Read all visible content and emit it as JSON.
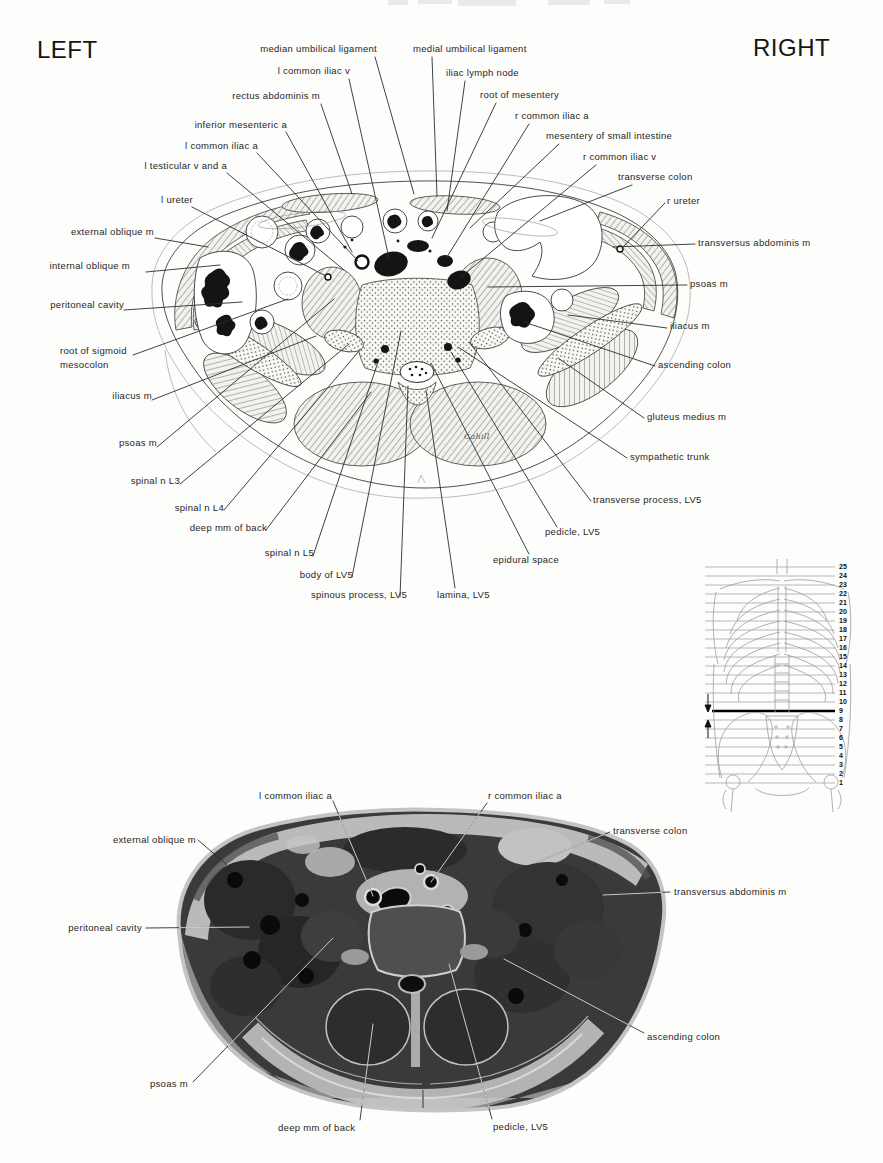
{
  "page": {
    "left_marker": "LEFT",
    "right_marker": "RIGHT",
    "artist_signature": "Cahill"
  },
  "figure_drawing": {
    "labels": [
      {
        "text": "median umbilical ligament"
      },
      {
        "text": "l common iliac v"
      },
      {
        "text": "rectus abdominis m"
      },
      {
        "text": "inferior mesenteric a"
      },
      {
        "text": "l common iliac a"
      },
      {
        "text": "l testicular v and a"
      },
      {
        "text": "l ureter"
      },
      {
        "text": "external oblique m"
      },
      {
        "text": "internal oblique m"
      },
      {
        "text": "peritoneal cavity"
      },
      {
        "text": "root of sigmoid\nmesocolon"
      },
      {
        "text": "iliacus m"
      },
      {
        "text": "psoas m"
      },
      {
        "text": "spinal n L3"
      },
      {
        "text": "spinal n L4"
      },
      {
        "text": "deep mm of back"
      },
      {
        "text": "spinal n L5"
      },
      {
        "text": "body of LV5"
      },
      {
        "text": "spinous process, LV5"
      },
      {
        "text": "lamina, LV5"
      },
      {
        "text": "medial umbilical ligament"
      },
      {
        "text": "iliac lymph node"
      },
      {
        "text": "root of mesentery"
      },
      {
        "text": "r common iliac a"
      },
      {
        "text": "mesentery of small intestine"
      },
      {
        "text": "r common iliac v"
      },
      {
        "text": "transverse colon"
      },
      {
        "text": "r ureter"
      },
      {
        "text": "transversus abdominis m"
      },
      {
        "text": "psoas m"
      },
      {
        "text": "iliacus m"
      },
      {
        "text": "ascending colon"
      },
      {
        "text": "gluteus medius m"
      },
      {
        "text": "sympathetic trunk"
      },
      {
        "text": "transverse process, LV5"
      },
      {
        "text": "pedicle, LV5"
      },
      {
        "text": "epidural space"
      }
    ]
  },
  "figure_photo": {
    "labels": [
      {
        "text": "l common iliac a"
      },
      {
        "text": "r common iliac a"
      },
      {
        "text": "external oblique m"
      },
      {
        "text": "transverse colon"
      },
      {
        "text": "transversus abdominis m"
      },
      {
        "text": "peritoneal cavity"
      },
      {
        "text": "ascending colon"
      },
      {
        "text": "psoas m"
      },
      {
        "text": "deep mm of back"
      },
      {
        "text": "pedicle, LV5"
      }
    ]
  },
  "locator": {
    "levels": [
      "25",
      "24",
      "23",
      "22",
      "21",
      "20",
      "19",
      "18",
      "17",
      "16",
      "15",
      "14",
      "13",
      "12",
      "11",
      "10",
      "9",
      "8",
      "7",
      "6",
      "5",
      "4",
      "3",
      "2",
      "1"
    ],
    "highlighted_level": "9",
    "arrow_above": "down-arrow-icon",
    "arrow_below": "up-arrow-icon"
  }
}
